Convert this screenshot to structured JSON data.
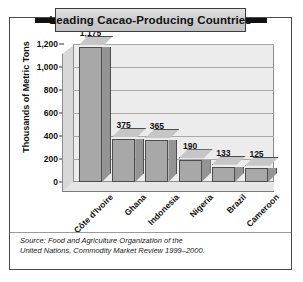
{
  "chart_data": {
    "type": "bar",
    "title": "Leading Cacao-Producing Countries",
    "xlabel": "",
    "ylabel": "Thousands of Metric Tons",
    "categories": [
      "Côte d'Ivoire",
      "Ghana",
      "Indonesia",
      "Nigeria",
      "Brazil",
      "Cameroon"
    ],
    "values": [
      1175,
      375,
      365,
      190,
      133,
      125
    ],
    "value_labels": [
      "1,175",
      "375",
      "365",
      "190",
      "133",
      "125"
    ],
    "ylim": [
      0,
      1200
    ],
    "yticks": [
      0,
      200,
      400,
      600,
      800,
      1000,
      1200
    ],
    "ytick_labels": [
      "0",
      "200",
      "400",
      "600",
      "800",
      "1,000",
      "1,200"
    ],
    "grid": true,
    "legend": false,
    "style": "3d-column",
    "colors": {
      "bar_front": "#a8a8a8",
      "bar_side": "#949494",
      "bar_top": "#c6c6c6",
      "bar_outline": "#4d4d4d",
      "plot_background": "#ececec",
      "gridline": "#a9a9a9",
      "title_plate": "#cfcfcf",
      "frame": "#4a4a4a",
      "text": "#111111"
    }
  },
  "source": {
    "line1": "Source: Food and Agriculture Organization of the",
    "line2": "United Nations, Commodity Market Review 1999–2000."
  }
}
